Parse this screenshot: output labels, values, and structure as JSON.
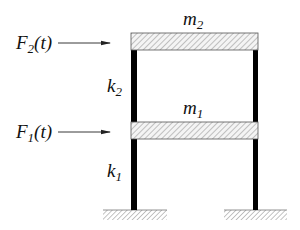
{
  "diagram": {
    "masses": [
      {
        "id": "m2",
        "symbol": "m",
        "subscript": "2",
        "level": "top"
      },
      {
        "id": "m1",
        "symbol": "m",
        "subscript": "1",
        "level": "middle"
      }
    ],
    "springs": [
      {
        "id": "k2",
        "symbol": "k",
        "subscript": "2",
        "story": "upper"
      },
      {
        "id": "k1",
        "symbol": "k",
        "subscript": "1",
        "story": "lower"
      }
    ],
    "forces": [
      {
        "id": "F2",
        "symbol": "F",
        "subscript": "2",
        "arg": "(t)",
        "applied_to": "m2"
      },
      {
        "id": "F1",
        "symbol": "F",
        "subscript": "1",
        "arg": "(t)",
        "applied_to": "m1"
      }
    ],
    "supports": [
      "left-fixed-ground",
      "right-fixed-ground"
    ],
    "colors": {
      "column": "#000000",
      "slab_fill": "#f4f4f4",
      "slab_hatch": "#8a8a8a",
      "slab_border": "#555555",
      "ground_hatch": "#8a8a8a",
      "arrow": "#222222",
      "text": "#111111"
    }
  }
}
